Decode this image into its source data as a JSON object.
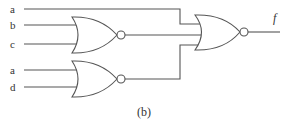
{
  "diagram": {
    "type": "logic-circuit",
    "caption": "(b)",
    "inputs": [
      {
        "id": "in1",
        "label": "a",
        "y": 9
      },
      {
        "id": "in2",
        "label": "b",
        "y": 25
      },
      {
        "id": "in3",
        "label": "c",
        "y": 44
      },
      {
        "id": "in4",
        "label": "a",
        "y": 70
      },
      {
        "id": "in5",
        "label": "d",
        "y": 87
      }
    ],
    "gates": [
      {
        "id": "nor1",
        "type": "NOR",
        "inputs": [
          "b",
          "c"
        ]
      },
      {
        "id": "nor2",
        "type": "NOR",
        "inputs": [
          "a",
          "d"
        ]
      },
      {
        "id": "nor3",
        "type": "NOR",
        "inputs": [
          "a",
          "nor1",
          "nor2"
        ],
        "output": "f"
      }
    ],
    "output": {
      "label": "f"
    },
    "colors": {
      "line": "#555555",
      "text": "#333333",
      "background": "#ffffff"
    }
  }
}
